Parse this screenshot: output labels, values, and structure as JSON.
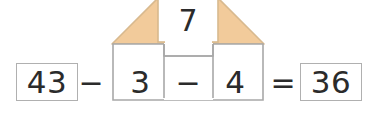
{
  "equation": {
    "minuend": "43",
    "operator_1": "−",
    "subtrahend_1": "3",
    "operator_2": "−",
    "subtrahend_2": "4",
    "equals": "=",
    "result": "36",
    "roof_value": "7"
  },
  "colors": {
    "roof_fill": "#f2cb9b",
    "roof_stroke": "#d8b98e",
    "box_border": "#b0b0b0",
    "house_border": "#a8a8a8",
    "text": "#2b2b2b",
    "background": "#ffffff"
  },
  "labels": {
    "house_figure": "house-shaped grouping diagram",
    "roof_box": "roof value box",
    "notch": "top notch in house body"
  }
}
